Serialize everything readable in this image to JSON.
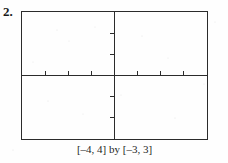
{
  "figure": {
    "problem_number": "2.",
    "caption": "[–4, 4] by [–3, 3]",
    "ink_color": "#2b2b2b",
    "background_color": "#fefefe"
  },
  "chart_data": {
    "type": "line",
    "title": "",
    "subtitle": "",
    "xlabel": "",
    "ylabel": "",
    "caption": "[–4, 4] by [–3, 3]",
    "xlim": [
      -4,
      4
    ],
    "ylim": [
      -3,
      3
    ],
    "xticks": [
      -3,
      -2,
      -1,
      1,
      2,
      3
    ],
    "yticks": [
      -2,
      -1,
      1,
      2
    ],
    "xtick_labels": [
      "",
      "",
      "",
      "",
      "",
      ""
    ],
    "ytick_labels": [
      "",
      "",
      "",
      ""
    ],
    "grid": false,
    "legend": null,
    "series": [],
    "annotations": [],
    "axes": {
      "x_axis_visible": true,
      "y_axis_visible": true,
      "x_axis_at_y": 0,
      "y_axis_at_x": 0,
      "tick_direction_x": "up",
      "tick_direction_y": "left",
      "tick_length_px": 5,
      "frame": true
    }
  }
}
